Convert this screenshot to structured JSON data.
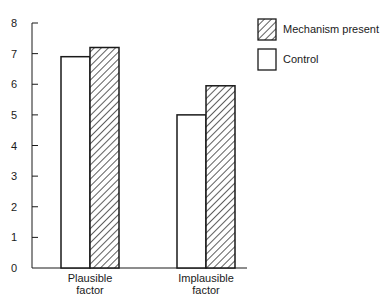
{
  "chart_data": {
    "type": "bar",
    "title": "",
    "xlabel": "",
    "ylabel": "",
    "categories": [
      "Plausible factor",
      "Implausible factor"
    ],
    "category_label_lines": [
      [
        "Plausible",
        "factor"
      ],
      [
        "Implausible",
        "factor"
      ]
    ],
    "series": [
      {
        "name": "Control",
        "values": [
          6.9,
          5.0
        ],
        "fill": "white"
      },
      {
        "name": "Mechanism present",
        "values": [
          7.2,
          5.95
        ],
        "fill": "hatched"
      }
    ],
    "ylim": [
      0,
      8
    ],
    "yticks": [
      0,
      1,
      2,
      3,
      4,
      5,
      6,
      7,
      8
    ],
    "grid": false,
    "legend": {
      "position": "top-right",
      "entries": [
        {
          "label": "Mechanism present",
          "fill": "hatched"
        },
        {
          "label": "Control",
          "fill": "white"
        }
      ]
    }
  },
  "colors": {
    "stroke": "#1a1a1a",
    "background": "#ffffff"
  }
}
